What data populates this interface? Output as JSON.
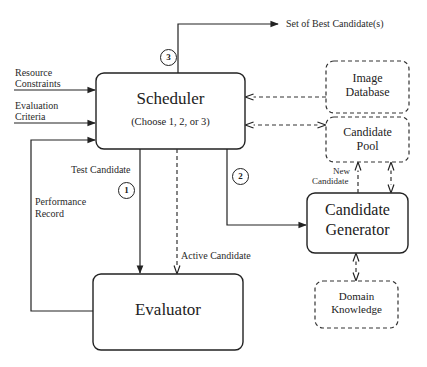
{
  "diagram": {
    "nodes": {
      "scheduler": {
        "title": "Scheduler",
        "subtitle": "(Choose 1, 2, or 3)",
        "style": "solid"
      },
      "evaluator": {
        "title": "Evaluator",
        "style": "solid"
      },
      "candidate_generator": {
        "line1": "Candidate",
        "line2": "Generator",
        "style": "solid"
      },
      "image_database": {
        "line1": "Image",
        "line2": "Database",
        "style": "dashed"
      },
      "candidate_pool": {
        "line1": "Candidate",
        "line2": "Pool",
        "style": "dashed"
      },
      "domain_knowledge": {
        "line1": "Domain",
        "line2": "Knowledge",
        "style": "dashed"
      }
    },
    "inputs": {
      "resource_constraints": {
        "line1": "Resource",
        "line2": "Constraints"
      },
      "evaluation_criteria": {
        "line1": "Evaluation",
        "line2": "Criteria"
      }
    },
    "edge_labels": {
      "output": "Set of Best Candidate(s)",
      "test_candidate": "Test Candidate",
      "active_candidate": "Active Candidate",
      "performance_record_1": "Performance",
      "performance_record_2": "Record",
      "new_candidate_1": "New",
      "new_candidate_2": "Candidate"
    },
    "choices": {
      "one": "1",
      "two": "2",
      "three": "3"
    },
    "edges": [
      {
        "from": "resource_constraints",
        "to": "scheduler",
        "style": "solid"
      },
      {
        "from": "evaluation_criteria",
        "to": "scheduler",
        "style": "solid"
      },
      {
        "from": "evaluator",
        "to": "scheduler",
        "label": "Performance Record",
        "style": "solid"
      },
      {
        "from": "scheduler",
        "to": "output",
        "label": "Set of Best Candidate(s)",
        "choice": "3",
        "style": "solid"
      },
      {
        "from": "scheduler",
        "to": "evaluator",
        "label": "Test Candidate",
        "choice": "1",
        "style": "solid"
      },
      {
        "from": "scheduler",
        "to": "evaluator",
        "label": "Active Candidate",
        "style": "dashed"
      },
      {
        "from": "scheduler",
        "to": "candidate_generator",
        "choice": "2",
        "style": "solid"
      },
      {
        "from": "image_database",
        "to": "scheduler",
        "style": "dashed"
      },
      {
        "from": "candidate_pool",
        "to": "scheduler",
        "style": "dashed",
        "bidirectional": true
      },
      {
        "from": "candidate_generator",
        "to": "candidate_pool",
        "label": "New Candidate",
        "style": "dashed"
      },
      {
        "from": "candidate_pool",
        "to": "candidate_generator",
        "style": "dashed",
        "bidirectional": true
      },
      {
        "from": "domain_knowledge",
        "to": "candidate_generator",
        "style": "dashed",
        "bidirectional": true
      }
    ]
  }
}
